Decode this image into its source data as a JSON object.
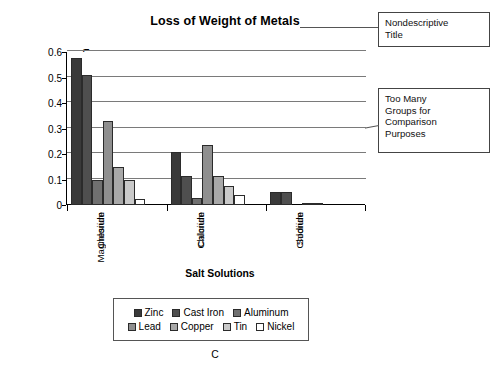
{
  "figure": {
    "caption": "C"
  },
  "annotations": [
    {
      "name": "nondescriptive-title",
      "lines": [
        "Nondescriptive",
        "Title"
      ]
    },
    {
      "name": "too-many-groups",
      "lines": [
        "Too Many",
        "Groups for",
        "Comparison",
        "Purposes"
      ]
    }
  ],
  "legend": {
    "rows": [
      [
        "Zinc",
        "Cast Iron",
        "Aluminum"
      ],
      [
        "Lead",
        "Copper",
        "Tin",
        "Nickel"
      ]
    ]
  },
  "chart_data": {
    "type": "bar",
    "title": "Loss of Weight of Metals",
    "xlabel": "Salt Solutions",
    "ylabel": "Weight Loss, g/sq.m/h",
    "categories": [
      "Magnesium Chloride",
      "Calcium Chloride",
      "Sodium Chloride"
    ],
    "category_lines": [
      [
        "Magnesium",
        "Chloride"
      ],
      [
        "Calcium",
        "Chloride"
      ],
      [
        "Sodium",
        "Chloride"
      ]
    ],
    "ylim": [
      0,
      0.6
    ],
    "yticks": [
      0,
      0.1,
      0.2,
      0.3,
      0.4,
      0.5,
      0.6
    ],
    "ytick_labels": [
      "0",
      "0.1",
      "0.2",
      "0.3",
      "0.4",
      "0.5",
      "0.6"
    ],
    "grid": true,
    "legend_position": "bottom",
    "series": [
      {
        "name": "Zinc",
        "color": "#3a3a3a",
        "values": [
          0.575,
          0.207,
          0.052
        ]
      },
      {
        "name": "Cast Iron",
        "color": "#4f4f4f",
        "values": [
          0.51,
          0.115,
          0.05
        ]
      },
      {
        "name": "Aluminum",
        "color": "#707070",
        "values": [
          0.1,
          0.027,
          0.0
        ]
      },
      {
        "name": "Lead",
        "color": "#8f8f8f",
        "values": [
          0.33,
          0.235,
          0.004
        ]
      },
      {
        "name": "Copper",
        "color": "#a8a8a8",
        "values": [
          0.15,
          0.115,
          0.004
        ]
      },
      {
        "name": "Tin",
        "color": "#c9c9c9",
        "values": [
          0.1,
          0.073,
          0.0
        ]
      },
      {
        "name": "Nickel",
        "color": "#ffffff",
        "values": [
          0.025,
          0.04,
          0.0
        ]
      }
    ]
  }
}
